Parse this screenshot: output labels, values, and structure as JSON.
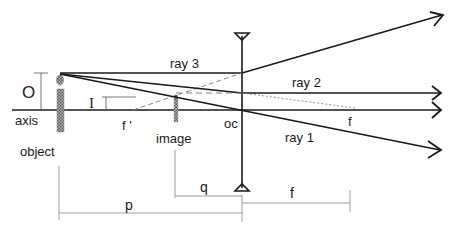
{
  "diagram": {
    "labels": {
      "object_height": "O",
      "image_height": "I",
      "axis": "axis",
      "object": "object",
      "image": "image",
      "focal_near": "f '",
      "optical_center": "oc",
      "focal_far": "f",
      "ray1": "ray 1",
      "ray2": "ray 2",
      "ray3": "ray 3",
      "object_distance": "p",
      "image_distance": "q",
      "focal_length": "f"
    },
    "colors": {
      "line": "#1a1a1a",
      "dashed": "#777777",
      "object_fill": "#999999",
      "background": "#ffffff"
    }
  }
}
